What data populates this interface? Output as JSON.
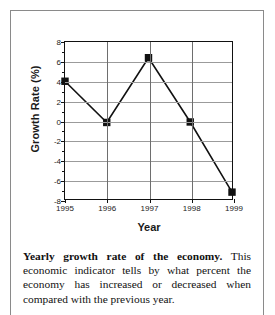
{
  "figure": {
    "caption_lead": "Yearly growth rate of the economy.",
    "caption_body": " This economic indicator tells by what percent the economy has increased or decreased when compared with the previous year."
  },
  "chart_data": {
    "type": "line",
    "title": "",
    "xlabel": "Year",
    "ylabel": "Growth Rate (%)",
    "categories": [
      "1995",
      "1996",
      "1997",
      "1998",
      "1999"
    ],
    "x": [
      1995,
      1996,
      1997,
      1998,
      1999
    ],
    "values": [
      4.0,
      -0.2,
      6.4,
      -0.15,
      -7.3
    ],
    "series": [
      {
        "name": "Growth Rate (%)",
        "values": [
          4.0,
          -0.2,
          6.4,
          -0.15,
          -7.3
        ]
      }
    ],
    "ylim": [
      -8,
      8
    ],
    "yticks": [
      8,
      6,
      4,
      2,
      0,
      -2,
      -4,
      -6,
      -8
    ],
    "ytick_labels": [
      "8",
      "6",
      "4",
      "2",
      "0",
      "-2",
      "-4",
      "-6",
      "-8"
    ],
    "xticks": [
      1995,
      1996,
      1997,
      1998,
      1999
    ],
    "xtick_labels": [
      "1995",
      "1996",
      "1997",
      "1998",
      "1999"
    ],
    "grid": true,
    "legend": false,
    "marker": "square",
    "line_color": "#111111",
    "marker_color": "#111111",
    "grid_color": "#9b9b9b",
    "axis_color": "#111111"
  }
}
